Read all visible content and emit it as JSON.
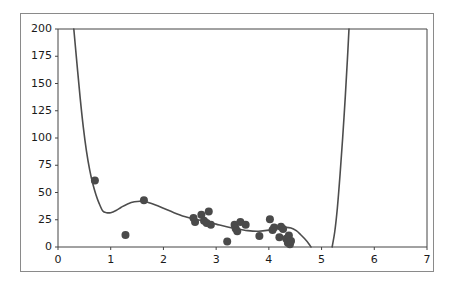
{
  "figure": {
    "width": 449,
    "height": 285,
    "background_color": "#ffffff",
    "border_color": "#8a8a8a",
    "title": "",
    "has_legend": false,
    "has_grid": false
  },
  "style": {
    "curve_color": "#4d4d4d",
    "point_color": "#4a4a4a",
    "axis_color": "#444444",
    "tick_label_color": "#1a1a1a",
    "point_radius": 4.0,
    "curve_width": 1.6
  },
  "axes": {
    "x": {
      "label": "",
      "min": 0,
      "max": 7,
      "ticks": [
        0,
        1,
        2,
        3,
        4,
        5,
        6,
        7
      ],
      "tick_labels": [
        "0",
        "1",
        "2",
        "3",
        "4",
        "5",
        "6",
        "7"
      ],
      "pixel_min": 58,
      "pixel_max": 427
    },
    "y": {
      "label": "",
      "min": 0,
      "max": 200,
      "ticks": [
        0,
        25,
        50,
        75,
        100,
        125,
        150,
        175,
        200
      ],
      "tick_labels": [
        "0",
        "25",
        "50",
        "75",
        "100",
        "125",
        "150",
        "175",
        "200"
      ],
      "pixel_min": 247,
      "pixel_max": 29
    }
  },
  "chart_data": {
    "type": "scatter",
    "title": "",
    "xlabel": "",
    "ylabel": "",
    "xlim": [
      0,
      7
    ],
    "ylim": [
      0,
      200
    ],
    "grid": false,
    "legend": null,
    "series": [
      {
        "name": "observations",
        "type": "scatter",
        "marker": "circle",
        "color": "#4a4a4a",
        "points": [
          {
            "x": 0.7,
            "y": 61.0
          },
          {
            "x": 1.28,
            "y": 11.0
          },
          {
            "x": 1.63,
            "y": 43.0
          },
          {
            "x": 2.57,
            "y": 26.5
          },
          {
            "x": 2.6,
            "y": 23.0
          },
          {
            "x": 2.72,
            "y": 29.5
          },
          {
            "x": 2.77,
            "y": 24.0
          },
          {
            "x": 2.82,
            "y": 22.0
          },
          {
            "x": 2.86,
            "y": 32.5
          },
          {
            "x": 2.9,
            "y": 20.5
          },
          {
            "x": 3.21,
            "y": 5.0
          },
          {
            "x": 3.35,
            "y": 20.5
          },
          {
            "x": 3.37,
            "y": 17.0
          },
          {
            "x": 3.4,
            "y": 14.5
          },
          {
            "x": 3.46,
            "y": 23.0
          },
          {
            "x": 3.56,
            "y": 20.5
          },
          {
            "x": 3.82,
            "y": 10.0
          },
          {
            "x": 4.02,
            "y": 25.5
          },
          {
            "x": 4.07,
            "y": 15.5
          },
          {
            "x": 4.1,
            "y": 18.0
          },
          {
            "x": 4.2,
            "y": 9.0
          },
          {
            "x": 4.23,
            "y": 18.5
          },
          {
            "x": 4.27,
            "y": 16.5
          },
          {
            "x": 4.33,
            "y": 7.5
          },
          {
            "x": 4.36,
            "y": 4.0
          },
          {
            "x": 4.38,
            "y": 10.5
          },
          {
            "x": 4.4,
            "y": 2.5
          },
          {
            "x": 4.42,
            "y": 5.5
          }
        ]
      },
      {
        "name": "fitted-curve",
        "type": "line",
        "color": "#4d4d4d",
        "points": [
          {
            "x": 0.3,
            "y": 200.0
          },
          {
            "x": 0.36,
            "y": 168.0
          },
          {
            "x": 0.42,
            "y": 137.0
          },
          {
            "x": 0.48,
            "y": 110.0
          },
          {
            "x": 0.54,
            "y": 88.0
          },
          {
            "x": 0.6,
            "y": 71.0
          },
          {
            "x": 0.66,
            "y": 58.0
          },
          {
            "x": 0.72,
            "y": 48.0
          },
          {
            "x": 0.78,
            "y": 40.0
          },
          {
            "x": 0.85,
            "y": 33.0
          },
          {
            "x": 0.92,
            "y": 31.5
          },
          {
            "x": 1.0,
            "y": 31.5
          },
          {
            "x": 1.1,
            "y": 33.5
          },
          {
            "x": 1.2,
            "y": 36.5
          },
          {
            "x": 1.32,
            "y": 39.5
          },
          {
            "x": 1.45,
            "y": 41.5
          },
          {
            "x": 1.58,
            "y": 42.0
          },
          {
            "x": 1.7,
            "y": 41.0
          },
          {
            "x": 1.85,
            "y": 38.5
          },
          {
            "x": 2.0,
            "y": 35.5
          },
          {
            "x": 2.2,
            "y": 31.5
          },
          {
            "x": 2.4,
            "y": 28.0
          },
          {
            "x": 2.6,
            "y": 25.5
          },
          {
            "x": 2.8,
            "y": 23.5
          },
          {
            "x": 3.0,
            "y": 21.0
          },
          {
            "x": 3.2,
            "y": 18.5
          },
          {
            "x": 3.4,
            "y": 16.5
          },
          {
            "x": 3.6,
            "y": 15.0
          },
          {
            "x": 3.8,
            "y": 14.5
          },
          {
            "x": 4.0,
            "y": 15.5
          },
          {
            "x": 4.15,
            "y": 17.0
          },
          {
            "x": 4.3,
            "y": 18.0
          },
          {
            "x": 4.42,
            "y": 17.5
          },
          {
            "x": 4.52,
            "y": 15.0
          },
          {
            "x": 4.6,
            "y": 11.5
          },
          {
            "x": 4.68,
            "y": 7.5
          },
          {
            "x": 4.75,
            "y": 3.5
          },
          {
            "x": 4.8,
            "y": 0.0
          }
        ]
      },
      {
        "name": "fitted-curve-right-branch",
        "type": "line",
        "color": "#4d4d4d",
        "points": [
          {
            "x": 5.2,
            "y": 0.0
          },
          {
            "x": 5.25,
            "y": 14.0
          },
          {
            "x": 5.3,
            "y": 36.0
          },
          {
            "x": 5.35,
            "y": 66.0
          },
          {
            "x": 5.4,
            "y": 100.0
          },
          {
            "x": 5.45,
            "y": 138.0
          },
          {
            "x": 5.49,
            "y": 172.0
          },
          {
            "x": 5.52,
            "y": 200.0
          }
        ]
      }
    ]
  }
}
